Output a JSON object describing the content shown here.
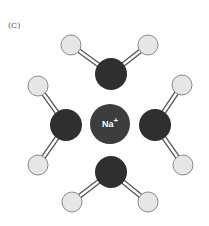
{
  "panel_label": "(C)",
  "center_ion": {
    "label": "Na",
    "charge": "+",
    "cx": 110,
    "cy": 124,
    "r": 20,
    "fill": "#3d3d3d",
    "text_color": "#ffffff"
  },
  "colors": {
    "oxygen": "#2f2f2f",
    "hydrogen_fill": "#e6e6e6",
    "hydrogen_stroke": "#8a8a8a",
    "bond_outer": "#555555",
    "bond_inner": "#ffffff"
  },
  "molecules": [
    {
      "name": "water-top",
      "O": {
        "cx": 111,
        "cy": 74,
        "r": 16
      },
      "H": [
        {
          "cx": 71,
          "cy": 45,
          "r": 10
        },
        {
          "cx": 148,
          "cy": 45,
          "r": 10
        }
      ]
    },
    {
      "name": "water-left",
      "O": {
        "cx": 66,
        "cy": 125,
        "r": 16
      },
      "H": [
        {
          "cx": 38,
          "cy": 86,
          "r": 10
        },
        {
          "cx": 38,
          "cy": 165,
          "r": 10
        }
      ]
    },
    {
      "name": "water-right",
      "O": {
        "cx": 155,
        "cy": 125,
        "r": 16
      },
      "H": [
        {
          "cx": 182,
          "cy": 85,
          "r": 10
        },
        {
          "cx": 183,
          "cy": 165,
          "r": 10
        }
      ]
    },
    {
      "name": "water-bottom",
      "O": {
        "cx": 111,
        "cy": 172,
        "r": 16
      },
      "H": [
        {
          "cx": 72,
          "cy": 202,
          "r": 10
        },
        {
          "cx": 148,
          "cy": 202,
          "r": 10
        }
      ]
    }
  ]
}
